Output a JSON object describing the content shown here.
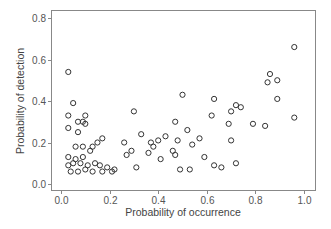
{
  "chart_data": {
    "type": "scatter",
    "title": "",
    "xlabel": "Probability of occurrence",
    "ylabel": "Probability of detection",
    "xlim": [
      -0.04,
      1.04
    ],
    "ylim": [
      -0.02,
      0.84
    ],
    "xticks": [
      0.0,
      0.2,
      0.4,
      0.6,
      0.8,
      1.0
    ],
    "xtick_labels": [
      "0.0",
      "0.2",
      "0.4",
      "0.6",
      "0.8",
      "1.0"
    ],
    "yticks": [
      0.0,
      0.2,
      0.4,
      0.6,
      0.8
    ],
    "ytick_labels": [
      "0.0",
      "0.2",
      "0.4",
      "0.6",
      "0.8"
    ],
    "grid": false,
    "legend": null,
    "marker": "open-circle",
    "points": [
      {
        "x": 0.03,
        "y": 0.54
      },
      {
        "x": 0.05,
        "y": 0.39
      },
      {
        "x": 0.03,
        "y": 0.33
      },
      {
        "x": 0.1,
        "y": 0.33
      },
      {
        "x": 0.07,
        "y": 0.3
      },
      {
        "x": 0.09,
        "y": 0.3
      },
      {
        "x": 0.1,
        "y": 0.29
      },
      {
        "x": 0.03,
        "y": 0.27
      },
      {
        "x": 0.07,
        "y": 0.25
      },
      {
        "x": 0.06,
        "y": 0.18
      },
      {
        "x": 0.09,
        "y": 0.18
      },
      {
        "x": 0.13,
        "y": 0.18
      },
      {
        "x": 0.15,
        "y": 0.2
      },
      {
        "x": 0.17,
        "y": 0.22
      },
      {
        "x": 0.12,
        "y": 0.16
      },
      {
        "x": 0.03,
        "y": 0.13
      },
      {
        "x": 0.06,
        "y": 0.12
      },
      {
        "x": 0.08,
        "y": 0.1
      },
      {
        "x": 0.11,
        "y": 0.09
      },
      {
        "x": 0.14,
        "y": 0.1
      },
      {
        "x": 0.16,
        "y": 0.09
      },
      {
        "x": 0.19,
        "y": 0.08
      },
      {
        "x": 0.22,
        "y": 0.07
      },
      {
        "x": 0.03,
        "y": 0.09
      },
      {
        "x": 0.04,
        "y": 0.06
      },
      {
        "x": 0.07,
        "y": 0.06
      },
      {
        "x": 0.1,
        "y": 0.07
      },
      {
        "x": 0.13,
        "y": 0.06
      },
      {
        "x": 0.17,
        "y": 0.06
      },
      {
        "x": 0.21,
        "y": 0.06
      },
      {
        "x": 0.05,
        "y": 0.1
      },
      {
        "x": 0.09,
        "y": 0.13
      },
      {
        "x": 0.27,
        "y": 0.14
      },
      {
        "x": 0.29,
        "y": 0.16
      },
      {
        "x": 0.26,
        "y": 0.2
      },
      {
        "x": 0.3,
        "y": 0.35
      },
      {
        "x": 0.33,
        "y": 0.24
      },
      {
        "x": 0.37,
        "y": 0.2
      },
      {
        "x": 0.38,
        "y": 0.18
      },
      {
        "x": 0.36,
        "y": 0.15
      },
      {
        "x": 0.31,
        "y": 0.08
      },
      {
        "x": 0.4,
        "y": 0.21
      },
      {
        "x": 0.41,
        "y": 0.12
      },
      {
        "x": 0.43,
        "y": 0.23
      },
      {
        "x": 0.46,
        "y": 0.16
      },
      {
        "x": 0.47,
        "y": 0.14
      },
      {
        "x": 0.47,
        "y": 0.3
      },
      {
        "x": 0.48,
        "y": 0.21
      },
      {
        "x": 0.5,
        "y": 0.43
      },
      {
        "x": 0.52,
        "y": 0.26
      },
      {
        "x": 0.49,
        "y": 0.07
      },
      {
        "x": 0.53,
        "y": 0.07
      },
      {
        "x": 0.54,
        "y": 0.19
      },
      {
        "x": 0.57,
        "y": 0.22
      },
      {
        "x": 0.59,
        "y": 0.13
      },
      {
        "x": 0.62,
        "y": 0.33
      },
      {
        "x": 0.63,
        "y": 0.41
      },
      {
        "x": 0.63,
        "y": 0.09
      },
      {
        "x": 0.66,
        "y": 0.08
      },
      {
        "x": 0.69,
        "y": 0.29
      },
      {
        "x": 0.7,
        "y": 0.35
      },
      {
        "x": 0.72,
        "y": 0.38
      },
      {
        "x": 0.74,
        "y": 0.37
      },
      {
        "x": 0.7,
        "y": 0.21
      },
      {
        "x": 0.72,
        "y": 0.1
      },
      {
        "x": 0.79,
        "y": 0.29
      },
      {
        "x": 0.84,
        "y": 0.28
      },
      {
        "x": 0.85,
        "y": 0.49
      },
      {
        "x": 0.86,
        "y": 0.53
      },
      {
        "x": 0.89,
        "y": 0.5
      },
      {
        "x": 0.89,
        "y": 0.41
      },
      {
        "x": 0.96,
        "y": 0.66
      },
      {
        "x": 0.96,
        "y": 0.32
      }
    ]
  }
}
